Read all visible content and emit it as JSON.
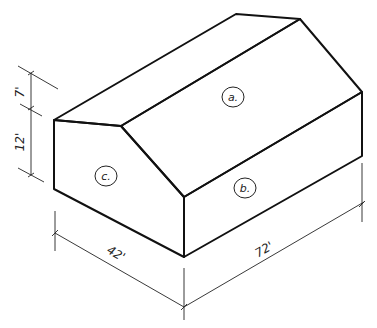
{
  "diagram": {
    "faces": [
      {
        "id": "a",
        "label": "a.",
        "description": "roof plane"
      },
      {
        "id": "b",
        "label": "b.",
        "description": "long side wall"
      },
      {
        "id": "c",
        "label": "c.",
        "description": "gable end wall"
      }
    ],
    "dimensions": {
      "roof_rise": "7'",
      "wall_height": "12'",
      "width": "42'",
      "length": "72'"
    },
    "colors": {
      "line": "#111111",
      "background": "#ffffff"
    }
  }
}
